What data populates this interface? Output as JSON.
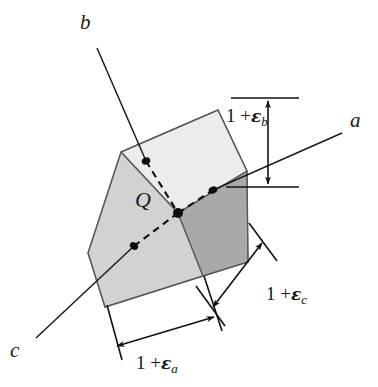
{
  "figure": {
    "type": "technical-diagram",
    "background_color": "#ffffff",
    "axes": [
      {
        "id": "b",
        "label": "b",
        "label_pos": [
          84,
          20
        ],
        "direction": "upper-left",
        "line": [
          [
            97,
            48
          ],
          [
            175,
            213
          ]
        ]
      },
      {
        "id": "a",
        "label": "a",
        "label_pos": [
          352,
          119
        ],
        "direction": "right",
        "line": [
          [
            178,
            213
          ],
          [
            342,
            133
          ]
        ]
      },
      {
        "id": "c",
        "label": "c",
        "label_pos": [
          12,
          348
        ],
        "direction": "lower-left",
        "line": [
          [
            178,
            214
          ],
          [
            36,
            338
          ]
        ]
      }
    ],
    "center_point": {
      "label": "Q",
      "label_pos": [
        137,
        196
      ],
      "x": 178,
      "y": 213
    },
    "face_dots": [
      {
        "name": "top-face-dot",
        "x": 146,
        "y": 161
      },
      {
        "name": "right-face-dot",
        "x": 213,
        "y": 190
      },
      {
        "name": "left-face-dot",
        "x": 134,
        "y": 246
      },
      {
        "name": "center-dot",
        "x": 178,
        "y": 213
      }
    ],
    "cube": {
      "top_face_color": "#ececec",
      "left_face_color": "#d2d2d2",
      "right_face_color": "#a9a9a9",
      "edge_color": "#4a4a4a",
      "vertices": {
        "top": [
          218,
          110
        ],
        "top_left": [
          121,
          152
        ],
        "top_right": [
          247,
          171
        ],
        "center_front": [
          178,
          213
        ],
        "left": [
          88,
          253
        ],
        "right": [
          248,
          262
        ],
        "bottom_front": [
          203,
          276
        ],
        "bottom_left": [
          105,
          307
        ]
      }
    },
    "dimensions": [
      {
        "id": "eps_b",
        "text_prefix": "1 +",
        "symbol": "ε",
        "subscript": "b",
        "label_pos": [
          247,
          115
        ],
        "orientation": "vertical",
        "arrow": [
          [
            268,
            103
          ],
          [
            268,
            185
          ]
        ],
        "extension_lines": [
          [
            [
              232,
              98
            ],
            [
              300,
              98
            ]
          ],
          [
            [
              227,
              186
            ],
            [
              300,
              186
            ]
          ]
        ]
      },
      {
        "id": "eps_c",
        "text_prefix": "1 +",
        "symbol": "ε",
        "subscript": "c",
        "label_pos": [
          244,
          285
        ],
        "orientation": "diagonal-up-right",
        "arrow": [
          [
            212,
            307
          ],
          [
            262,
            242
          ]
        ],
        "extension_lines": [
          [
            [
              196,
              288
            ],
            [
              226,
              327
            ]
          ],
          [
            [
              250,
              224
            ],
            [
              276,
              259
            ]
          ]
        ]
      },
      {
        "id": "eps_a",
        "text_prefix": "1 +",
        "symbol": "ε",
        "subscript": "a",
        "label_pos": [
          140,
          335
        ],
        "orientation": "horizontal-tilted",
        "arrow": [
          [
            118,
            345
          ],
          [
            213,
            317
          ]
        ],
        "extension_lines": [
          [
            [
              108,
              306
            ],
            [
              121,
              359
            ]
          ],
          [
            [
              205,
              276
            ],
            [
              221,
              330
            ]
          ]
        ]
      }
    ]
  }
}
